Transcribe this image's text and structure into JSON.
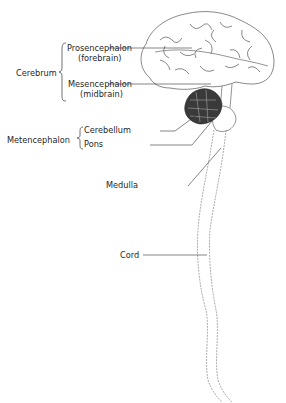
{
  "diagram": {
    "type": "anatomical-illustration",
    "groups": [
      {
        "name": "Cerebrum",
        "members": [
          {
            "label": "Prosencephalon",
            "sub": "(forebrain)"
          },
          {
            "label": "Mesencephalon",
            "sub": "(midbrain)"
          }
        ]
      },
      {
        "name": "Metencephalon",
        "members": [
          {
            "label": "Cerebellum"
          },
          {
            "label": "Pons"
          }
        ]
      }
    ],
    "standalone_labels": [
      "Medulla",
      "Cord"
    ]
  },
  "labels": {
    "cerebrum": "Cerebrum",
    "prosencephalon": "Prosencephalon",
    "forebrain": "(forebrain)",
    "mesencephalon": "Mesencephalon",
    "midbrain": "(midbrain)",
    "metencephalon": "Metencephalon",
    "cerebellum": "Cerebellum",
    "pons": "Pons",
    "medulla": "Medulla",
    "cord": "Cord"
  },
  "colors": {
    "ink": "#1f1f1f",
    "line": "#333333",
    "background": "#ffffff"
  }
}
